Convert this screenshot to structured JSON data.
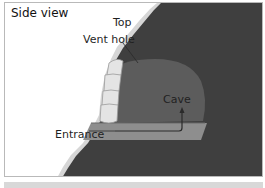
{
  "diagram": {
    "title": "Side view",
    "labels": {
      "top": "Top",
      "vent_hole": "Vent hole",
      "cave": "Cave",
      "entrance": "Entrance"
    },
    "colors": {
      "slope": "#3f3f3f",
      "slope_edge": "#d6d6d6",
      "cave": "#5a5a5a",
      "entrance_tunnel": "#8a8a8a",
      "snow_blocks": "#e2e2e2",
      "frame_border": "#b9b9b9",
      "text": "#1f1f1f"
    }
  }
}
